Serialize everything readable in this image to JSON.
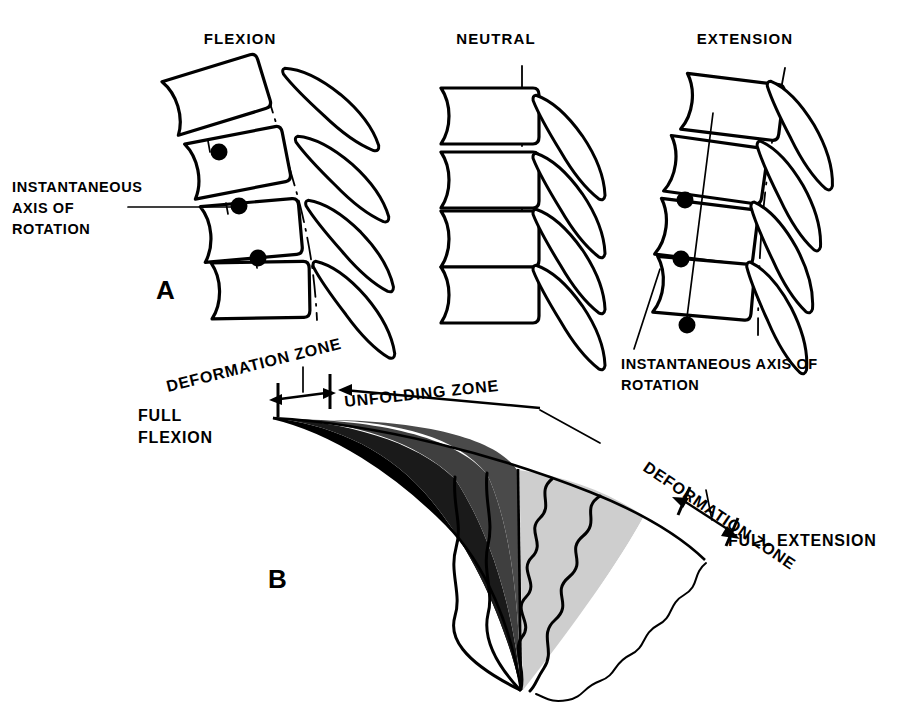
{
  "figure": {
    "kind": "anatomical-line-diagram",
    "background_color": "#ffffff",
    "ink_color": "#000000",
    "width": 899,
    "height": 711
  },
  "panel_a": {
    "letter": "A",
    "titles": {
      "flexion": "FLEXION",
      "neutral": "NEUTRAL",
      "extension": "EXTENSION"
    },
    "callout_left": {
      "line1": "INSTANTANEOUS",
      "line2": "AXIS OF",
      "line3": "ROTATION"
    },
    "callout_right": {
      "line1": "INSTANTANEOUS AXIS OF",
      "line2": "ROTATION"
    },
    "vertebrae_per_column": 4,
    "spinous_processes_per_column": 4,
    "iar_dots_flexion": 3,
    "iar_dots_extension": 3
  },
  "panel_b": {
    "letter": "B",
    "labels": {
      "deformation_zone_left": "DEFORMATION ZONE",
      "deformation_zone_right": "DEFORMATION ZONE",
      "unfolding_zone": "UNFOLDING ZONE",
      "full_flexion_line1": "FULL",
      "full_flexion_line2": "FLEXION",
      "full_extension": "FULL EXTENSION"
    },
    "zone_fills": {
      "black": "#000000",
      "dark_gray": "#3d3d3d",
      "mid_gray": "#555555",
      "light_gray": "#cfcfcf",
      "white": "#ffffff"
    }
  }
}
